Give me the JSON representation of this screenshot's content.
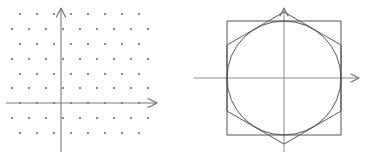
{
  "figure": {
    "title": "",
    "background_color": "#ffffff",
    "width": 373,
    "height": 157,
    "panel_count": 2
  },
  "colors": {
    "dot": "#6e6e74",
    "axis": "#7a7a80",
    "axis_thin": "#8a8a90",
    "outline": "#4c4c52",
    "background": "#ffffff"
  },
  "chart_data": [
    {
      "type": "scatter",
      "name": "triangular-lattice-with-axes",
      "title": "",
      "subtitle": "",
      "xlabel": "",
      "ylabel": "",
      "grid": false,
      "legend": null,
      "axis_style": "arrowed-cartesian",
      "origin_px": [
        61,
        103
      ],
      "xlim": [
        -3.6,
        6.6
      ],
      "ylim": [
        -2.6,
        6.6
      ],
      "lattice": {
        "description": "Triangular (hexagonal) point lattice; alternate rows offset by half a step.",
        "x_spacing_px": 17.0,
        "y_spacing_px": 14.8,
        "row_offset_px": 8.5,
        "dot_radius_px": 1.1,
        "rows": [
          {
            "y_px": 14,
            "offset": true,
            "x_px": [
              20,
              37,
              54,
              71,
              88,
              105,
              122,
              139
            ]
          },
          {
            "y_px": 29,
            "offset": false,
            "x_px": [
              12,
              29,
              46,
              63,
              80,
              97,
              114,
              131,
              148
            ]
          },
          {
            "y_px": 44,
            "offset": true,
            "x_px": [
              20,
              37,
              54,
              71,
              88,
              105,
              122,
              139
            ]
          },
          {
            "y_px": 59,
            "offset": false,
            "x_px": [
              12,
              29,
              46,
              63,
              80,
              97,
              114,
              131,
              148
            ]
          },
          {
            "y_px": 74,
            "offset": true,
            "x_px": [
              20,
              37,
              54,
              71,
              88,
              105,
              122,
              139
            ]
          },
          {
            "y_px": 88,
            "offset": false,
            "x_px": [
              12,
              29,
              46,
              63,
              80,
              97,
              114,
              131,
              148
            ]
          },
          {
            "y_px": 103,
            "offset": true,
            "x_px": [
              20,
              37,
              54,
              71,
              88,
              105,
              122,
              139
            ]
          },
          {
            "y_px": 118,
            "offset": false,
            "x_px": [
              12,
              29,
              46,
              63,
              80,
              97,
              114,
              131,
              148
            ]
          },
          {
            "y_px": 133,
            "offset": true,
            "x_px": [
              20,
              37,
              54,
              71,
              88,
              105,
              122,
              139
            ]
          }
        ]
      },
      "axes": {
        "x_axis": {
          "y_px": 103,
          "x_start_px": 6,
          "x_end_px": 156,
          "arrow": "right"
        },
        "y_axis": {
          "x_px": 61,
          "y_start_px": 152,
          "y_end_px": 8,
          "arrow": "up"
        }
      }
    },
    {
      "type": "line",
      "name": "circle-inscribed-in-square-and-hexagon",
      "title": "",
      "subtitle": "",
      "xlabel": "",
      "ylabel": "",
      "grid": false,
      "legend": null,
      "axis_style": "arrowed-cartesian",
      "center_px": [
        98,
        78
      ],
      "shapes": [
        {
          "shape": "circle",
          "label": "inscribed circle",
          "center_px": [
            98,
            78
          ],
          "radius_px": 57
        },
        {
          "shape": "square",
          "label": "circumscribed square",
          "x_px": 41,
          "y_px": 21,
          "width_px": 114,
          "height_px": 114,
          "side_px": 114
        },
        {
          "shape": "hexagon",
          "label": "circumscribed hexagon (pointy-top)",
          "orientation": "pointy-top",
          "center_px": [
            98,
            78
          ],
          "circumradius_px": 66,
          "vertices_px": [
            [
              98,
              12
            ],
            [
              155,
              45
            ],
            [
              155,
              111
            ],
            [
              98,
              144
            ],
            [
              41,
              111
            ],
            [
              41,
              45
            ]
          ]
        }
      ],
      "axes": {
        "x_axis": {
          "y_px": 78,
          "x_start_px": 8,
          "x_end_px": 172,
          "arrow": "right"
        },
        "y_axis": {
          "x_px": 98,
          "y_start_px": 152,
          "y_end_px": 8,
          "arrow": "up"
        }
      }
    }
  ]
}
